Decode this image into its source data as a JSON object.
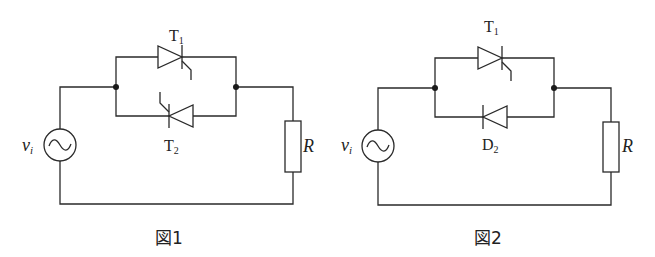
{
  "figures": [
    {
      "caption": "図1",
      "source": {
        "label": "v",
        "subscript": "i",
        "symbol": "~"
      },
      "top_device": {
        "type": "thyristor",
        "label": "T",
        "subscript": "1",
        "direction": "left-to-right"
      },
      "bottom_device": {
        "type": "thyristor",
        "label": "T",
        "subscript": "2",
        "direction": "right-to-left"
      },
      "load": {
        "type": "resistor",
        "label": "R"
      }
    },
    {
      "caption": "図2",
      "source": {
        "label": "v",
        "subscript": "i",
        "symbol": "~"
      },
      "top_device": {
        "type": "thyristor",
        "label": "T",
        "subscript": "1",
        "direction": "left-to-right"
      },
      "bottom_device": {
        "type": "diode",
        "label": "D",
        "subscript": "2",
        "direction": "right-to-left"
      },
      "load": {
        "type": "resistor",
        "label": "R"
      }
    }
  ],
  "colors": {
    "line": "#2a2a2a",
    "background": "#ffffff"
  }
}
